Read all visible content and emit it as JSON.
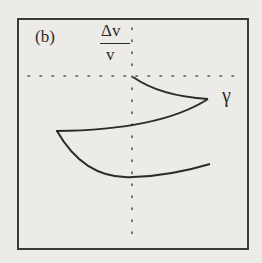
{
  "figure": {
    "panel_label": "(b)",
    "y_axis_label": {
      "numerator": "Δv",
      "denominator": "v"
    },
    "x_axis_label": "γ",
    "colors": {
      "background": "#ecebe8",
      "ink": "#2b2b2b",
      "dotted": "#555555"
    }
  },
  "diagram": {
    "frame": {
      "x": 18,
      "y": 19,
      "width": 230,
      "height": 230
    },
    "axes": {
      "vertical_dotted": {
        "x": 132,
        "y1": 28,
        "y2": 240
      },
      "horizontal_dotted": {
        "y": 76,
        "x1": 28,
        "x2": 236
      }
    },
    "curves": [
      {
        "name": "upper-branch-top",
        "d": "M133,77 Q160,96 208,99"
      },
      {
        "name": "upper-branch-bottom",
        "d": "M208,99 Q160,130 56,131"
      },
      {
        "name": "lower-branch",
        "d": "M57,131 Q85,180 133,177 Q170,176 210,164"
      }
    ]
  }
}
